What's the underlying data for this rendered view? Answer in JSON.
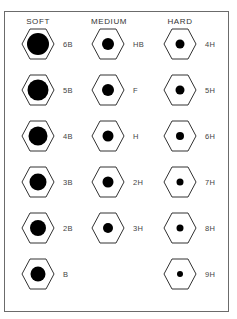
{
  "headers": [
    "SOFT",
    "MEDIUM",
    "HARD"
  ],
  "columns": [
    {
      "name": "SOFT",
      "items": [
        {
          "label": "6B",
          "dot": 11
        },
        {
          "label": "5B",
          "dot": 10.5
        },
        {
          "label": "4B",
          "dot": 9.5
        },
        {
          "label": "3B",
          "dot": 8.5
        },
        {
          "label": "2B",
          "dot": 8
        },
        {
          "label": "B",
          "dot": 7.5
        }
      ]
    },
    {
      "name": "MEDIUM",
      "items": [
        {
          "label": "HB",
          "dot": 6
        },
        {
          "label": "F",
          "dot": 6
        },
        {
          "label": "H",
          "dot": 5.5
        },
        {
          "label": "2H",
          "dot": 5.5
        },
        {
          "label": "3H",
          "dot": 5
        }
      ]
    },
    {
      "name": "HARD",
      "items": [
        {
          "label": "4H",
          "dot": 4.5
        },
        {
          "label": "5H",
          "dot": 4.5
        },
        {
          "label": "6H",
          "dot": 4
        },
        {
          "label": "7H",
          "dot": 3.5
        },
        {
          "label": "8H",
          "dot": 3.5
        },
        {
          "label": "9H",
          "dot": 3
        }
      ]
    }
  ],
  "colors": {
    "stroke": "#333333",
    "dot": "#000000",
    "frame": "#6b6b6b"
  }
}
